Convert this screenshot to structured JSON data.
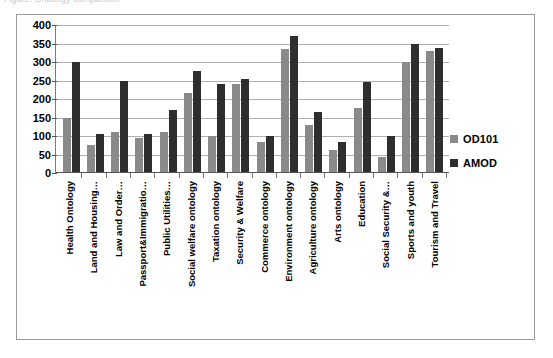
{
  "caption": {
    "text": "Figure: Ontology comparison"
  },
  "chart_data": {
    "type": "bar",
    "title": "",
    "xlabel": "",
    "ylabel": "",
    "ylim": [
      0,
      400
    ],
    "yticks": [
      400,
      350,
      300,
      250,
      200,
      150,
      100,
      50,
      0
    ],
    "grid": true,
    "legend_position": "right",
    "categories": [
      "Health Ontology",
      "Land and Housing…",
      "Law and Order…",
      "Passport&Immigratio…",
      "Public Utilities…",
      "Social welfare ontology",
      "Taxation ontology",
      "Security & Welfare",
      "Commerce ontology",
      "Environment ontology",
      "Agriculture ontology",
      "Arts ontology",
      "Education",
      "Social Security &…",
      "Sports and youth",
      "Tourism and Travel"
    ],
    "series": [
      {
        "name": "OD101",
        "color": "#8a8a8a",
        "values": [
          150,
          75,
          110,
          95,
          110,
          215,
          100,
          240,
          85,
          335,
          130,
          62,
          175,
          42,
          300,
          330
        ]
      },
      {
        "name": "AMOD",
        "color": "#2e2e2e",
        "values": [
          300,
          105,
          250,
          105,
          170,
          275,
          240,
          255,
          100,
          370,
          165,
          85,
          245,
          100,
          350,
          338
        ]
      }
    ]
  },
  "legend": {
    "items": [
      {
        "label": "OD101",
        "color": "#8a8a8a"
      },
      {
        "label": "AMOD",
        "color": "#2e2e2e"
      }
    ]
  }
}
